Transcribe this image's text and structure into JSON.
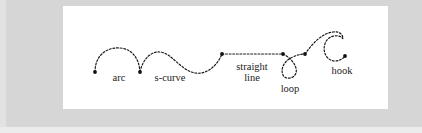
{
  "diagram": {
    "title": "",
    "stroke_style": "dotted",
    "colors": {
      "background": "#d6d6d6",
      "panel": "#ffffff",
      "ink": "#1a1a1a"
    },
    "segments": [
      {
        "id": "arc",
        "label": "arc"
      },
      {
        "id": "s-curve",
        "label": "s-curve"
      },
      {
        "id": "straight-line",
        "label_lines": [
          "straight",
          "line"
        ]
      },
      {
        "id": "loop",
        "label": "loop"
      },
      {
        "id": "hook",
        "label": "hook"
      }
    ],
    "node_count": 7
  }
}
